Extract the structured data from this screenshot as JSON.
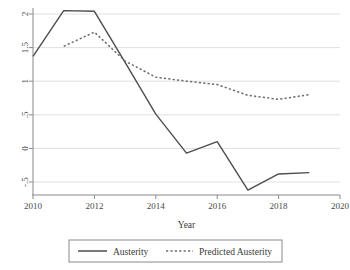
{
  "chart_data": {
    "type": "line",
    "title": "",
    "xlabel": "Year",
    "ylabel": "",
    "xlim": [
      2010,
      2020
    ],
    "ylim": [
      -0.5,
      2.0
    ],
    "grid": true,
    "grid_axis": "y",
    "legend_position": "bottom",
    "x_ticks": [
      2010,
      2012,
      2014,
      2016,
      2018,
      2020
    ],
    "x_tick_labels": [
      "2010",
      "2012",
      "2014",
      "2016",
      "2018",
      "2020"
    ],
    "y_ticks": [
      -0.5,
      0,
      0.5,
      1,
      1.5,
      2
    ],
    "y_tick_labels": [
      "-.5",
      "0",
      ".5",
      "1",
      "1.5",
      "2"
    ],
    "series": [
      {
        "name": "Austerity",
        "style": "solid",
        "color": "#4d4d4d",
        "x": [
          2010,
          2011,
          2012,
          2013,
          2014,
          2015,
          2016,
          2017,
          2018,
          2019
        ],
        "values": [
          1.37,
          2.05,
          2.04,
          1.28,
          0.51,
          -0.07,
          0.1,
          -0.62,
          -0.38,
          -0.36
        ]
      },
      {
        "name": "Predicted Austerity",
        "style": "dashed",
        "color": "#6b6b6b",
        "x": [
          2011,
          2012,
          2013,
          2014,
          2015,
          2016,
          2017,
          2018,
          2019
        ],
        "values": [
          1.52,
          1.73,
          1.3,
          1.06,
          1.0,
          0.95,
          0.79,
          0.73,
          0.8
        ]
      }
    ]
  },
  "axis": {
    "x_title": "Year"
  },
  "legend": {
    "entries": [
      {
        "label": "Austerity",
        "style": "solid"
      },
      {
        "label": "Predicted Austerity",
        "style": "dashed"
      }
    ]
  }
}
